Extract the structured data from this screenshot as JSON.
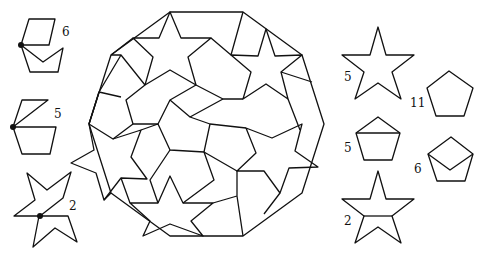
{
  "figure": {
    "title": "",
    "central_figure": "decagon tiled with stars, pentagons and rhombi",
    "left_pieces": [
      {
        "name": "pentagon-with-rhombus",
        "label": "6"
      },
      {
        "name": "pentagon-with-triangle",
        "label": "5"
      },
      {
        "name": "star-pair",
        "label": "2"
      }
    ],
    "right_pieces": [
      {
        "name": "star",
        "label": "5"
      },
      {
        "name": "pentagon",
        "label": "11"
      },
      {
        "name": "pentagon-with-cap",
        "label": "5"
      },
      {
        "name": "pentagon-with-v",
        "label": "6"
      },
      {
        "name": "star-split",
        "label": "2"
      }
    ],
    "colors": {
      "stroke": "#111111",
      "background": "#ffffff"
    }
  }
}
